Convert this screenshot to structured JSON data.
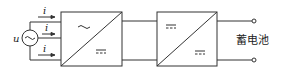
{
  "diagram": {
    "source": {
      "voltage_label": "u",
      "symbol": "ac-sine"
    },
    "currents": [
      {
        "label": "i"
      },
      {
        "label": "i"
      },
      {
        "label": "i"
      }
    ],
    "blocks": [
      {
        "name": "ac-dc-converter",
        "top_symbol": "~",
        "bottom_symbol": "dc"
      },
      {
        "name": "dc-dc-converter",
        "top_symbol": "dc",
        "bottom_symbol": "dc"
      }
    ],
    "output": {
      "label": "蓄电池"
    }
  }
}
